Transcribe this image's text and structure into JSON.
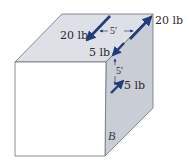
{
  "figure": {
    "colors": {
      "front_face": "#ffffff",
      "top_face": "#dde1e7",
      "side_face": "#c9ced6",
      "edge": "#6b6f78",
      "force_arrow": "#1f3d7a",
      "dim_arrow": "#1f3d7a"
    },
    "labels": {
      "force_top_left": "20 lb",
      "force_top_right": "20 lb",
      "force_corner": "5 lb",
      "force_side": "5 lb",
      "dim_horizontal": "5′",
      "dim_vertical": "5′",
      "point": "B"
    }
  }
}
